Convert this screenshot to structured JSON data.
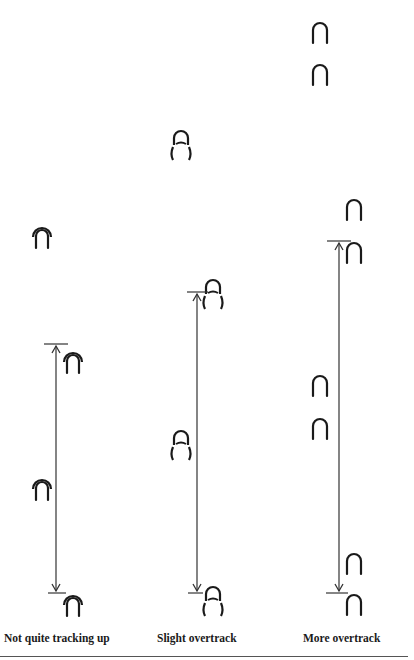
{
  "diagram": {
    "type": "hoofprint-tracking-comparison",
    "columns": [
      {
        "id": "not-quite-tracking-up",
        "caption": "Not quite tracking up",
        "prints": [
          {
            "x": 42,
            "y": 235,
            "style": "overlapping-front-hind"
          },
          {
            "x": 73,
            "y": 360,
            "style": "overlapping-front-hind"
          },
          {
            "x": 42,
            "y": 487,
            "style": "overlapping-front-hind"
          },
          {
            "x": 73,
            "y": 603,
            "style": "overlapping-front-hind"
          }
        ],
        "stride_arrow": {
          "x": 56,
          "y1": 344,
          "y2": 593,
          "tick_top_x1": 44,
          "tick_top_x2": 68,
          "tick_bottom_x1": 48,
          "tick_bottom_x2": 66
        }
      },
      {
        "id": "slight-overtrack",
        "caption": "Slight overtrack",
        "prints": [
          {
            "x": 181,
            "y": 147,
            "style": "hind-ahead-slightly"
          },
          {
            "x": 213,
            "y": 296,
            "style": "hind-ahead-slightly"
          },
          {
            "x": 181,
            "y": 447,
            "style": "hind-ahead-slightly"
          },
          {
            "x": 213,
            "y": 603,
            "style": "hind-ahead-slightly"
          }
        ],
        "stride_arrow": {
          "x": 197,
          "y1": 292,
          "y2": 593,
          "tick_top_x1": 187,
          "tick_top_x2": 208,
          "tick_bottom_x1": 188,
          "tick_bottom_x2": 203
        }
      },
      {
        "id": "more-overtrack",
        "caption": "More overtrack",
        "prints": [
          {
            "x": 320,
            "y": 33,
            "style": "single"
          },
          {
            "x": 320,
            "y": 75,
            "style": "single"
          },
          {
            "x": 354,
            "y": 210,
            "style": "single"
          },
          {
            "x": 354,
            "y": 253,
            "style": "single"
          },
          {
            "x": 320,
            "y": 386,
            "style": "single"
          },
          {
            "x": 320,
            "y": 429,
            "style": "single"
          },
          {
            "x": 354,
            "y": 564,
            "style": "single"
          },
          {
            "x": 354,
            "y": 605,
            "style": "single"
          }
        ],
        "stride_arrow": {
          "x": 339,
          "y1": 241,
          "y2": 593,
          "tick_top_x1": 327,
          "tick_top_x2": 351,
          "tick_bottom_x1": 326,
          "tick_bottom_x2": 348
        }
      }
    ],
    "colors": {
      "ink": "#1a1a1a",
      "line": "#333333",
      "background": "#ffffff"
    }
  }
}
